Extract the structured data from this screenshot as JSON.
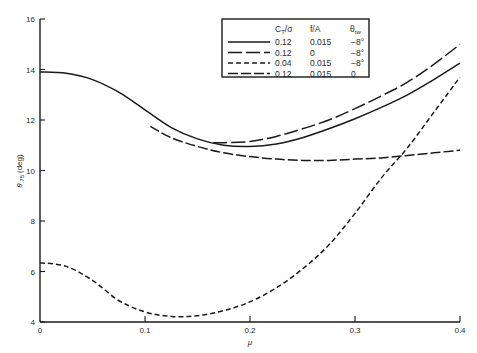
{
  "chart_data": {
    "type": "line",
    "title": "",
    "xlabel": "μ",
    "ylabel": "θ.75 (deg)",
    "ylabel_main": "θ",
    "ylabel_sub": ".75",
    "ylabel_unit": "(deg)",
    "xlim": [
      0,
      0.4
    ],
    "ylim": [
      4,
      16
    ],
    "x_ticks": [
      0,
      0.1,
      0.2,
      0.3,
      0.4
    ],
    "x_tick_labels": [
      "0",
      "0.1",
      "0.2",
      "0.3",
      "0.4"
    ],
    "y_ticks": [
      4,
      6,
      8,
      10,
      12,
      14,
      16
    ],
    "y_tick_labels": [
      "4",
      "6",
      "8",
      "10",
      "12",
      "14",
      "16"
    ],
    "grid": false,
    "legend_position": "upper-right",
    "legend": {
      "headers": [
        "C_T/σ",
        "f/A",
        "θ_tw"
      ],
      "header_ct_main": "C",
      "header_ct_sub": "T",
      "header_ct_rest": "/σ",
      "header_fa": "f/A",
      "header_tw_main": "θ",
      "header_tw_sub": "tw",
      "rows": [
        {
          "style": "solid",
          "ct_sigma": "0.12",
          "f_A": "0.015",
          "theta_tw": "−8°"
        },
        {
          "style": "long-dash",
          "ct_sigma": "0.12",
          "f_A": "0",
          "theta_tw": "−8°"
        },
        {
          "style": "short-dash",
          "ct_sigma": "0.04",
          "f_A": "0.015",
          "theta_tw": "−8°"
        },
        {
          "style": "dash",
          "ct_sigma": "0.12",
          "f_A": "0.015",
          "theta_tw": "0"
        }
      ]
    },
    "series": [
      {
        "name": "C_T/σ=0.12, f/A=0.015, θtw=−8°",
        "style": "solid",
        "x": [
          0,
          0.025,
          0.05,
          0.075,
          0.1,
          0.125,
          0.15,
          0.175,
          0.2,
          0.225,
          0.25,
          0.275,
          0.3,
          0.325,
          0.35,
          0.375,
          0.4
        ],
        "y": [
          13.9,
          13.85,
          13.6,
          13.1,
          12.4,
          11.7,
          11.25,
          11.0,
          10.95,
          11.05,
          11.3,
          11.65,
          12.05,
          12.5,
          13.0,
          13.6,
          14.25
        ]
      },
      {
        "name": "C_T/σ=0.12, f/A=0, θtw=−8°",
        "style": "long-dash",
        "x": [
          0.165,
          0.175,
          0.2,
          0.225,
          0.25,
          0.275,
          0.3,
          0.325,
          0.35,
          0.375,
          0.4
        ],
        "y": [
          11.1,
          11.1,
          11.15,
          11.35,
          11.65,
          12.0,
          12.45,
          12.95,
          13.5,
          14.2,
          15.0
        ]
      },
      {
        "name": "C_T/σ=0.04, f/A=0.015, θtw=−8°",
        "style": "short-dash",
        "x": [
          0,
          0.025,
          0.05,
          0.075,
          0.1,
          0.125,
          0.15,
          0.175,
          0.2,
          0.225,
          0.25,
          0.275,
          0.3,
          0.325,
          0.35,
          0.375,
          0.4
        ],
        "y": [
          6.35,
          6.2,
          5.65,
          4.85,
          4.4,
          4.22,
          4.25,
          4.45,
          4.8,
          5.35,
          6.1,
          7.05,
          8.3,
          9.7,
          10.9,
          12.3,
          13.7
        ]
      },
      {
        "name": "C_T/σ=0.12, f/A=0.015, θtw=0",
        "style": "dash",
        "x": [
          0.105,
          0.125,
          0.15,
          0.175,
          0.2,
          0.225,
          0.25,
          0.275,
          0.3,
          0.325,
          0.35,
          0.375,
          0.4
        ],
        "y": [
          11.75,
          11.3,
          10.95,
          10.7,
          10.55,
          10.45,
          10.4,
          10.4,
          10.45,
          10.5,
          10.6,
          10.7,
          10.8
        ]
      }
    ]
  },
  "colors": {
    "ink": "#1a1a1a",
    "background": "#ffffff"
  }
}
